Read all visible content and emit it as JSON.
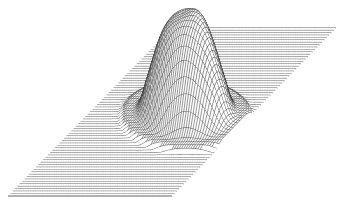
{
  "figure": {
    "background_color": "#ffffff",
    "line_color": "#1a1a1a"
  },
  "chart_data": {
    "type": "surface",
    "title": "",
    "xlabel": "",
    "ylabel": "",
    "zlabel": "",
    "grid": false,
    "legend": null,
    "render_style": "wireframe",
    "base_plane": {
      "corners_px": [
        [
          8,
          196
        ],
        [
          172,
          196
        ],
        [
          336,
          28
        ],
        [
          172,
          28
        ]
      ]
    },
    "peak": {
      "center_px": [
        186,
        118
      ],
      "base_radius_px": [
        40,
        22
      ],
      "height_px": 105,
      "shape": "steep gaussian-like plateau with slightly irregular top"
    },
    "ripples": {
      "count": 2,
      "amplitude_px": 4,
      "spacing_px": 14
    },
    "rows": 70,
    "cols": 70
  }
}
